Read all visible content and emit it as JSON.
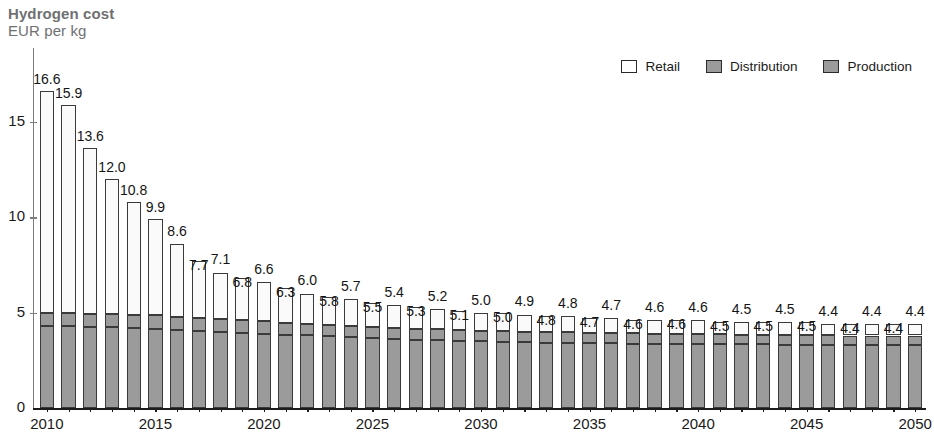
{
  "title": {
    "main": "Hydrogen cost",
    "sub": "EUR per kg"
  },
  "legend": {
    "position": "top-right",
    "items": [
      {
        "label": "Retail",
        "color": "#ffffff",
        "name": "retail"
      },
      {
        "label": "Distribution",
        "color": "#9b9b9b",
        "name": "distribution"
      },
      {
        "label": "Production",
        "color": "#9b9b9b",
        "name": "production"
      }
    ]
  },
  "chart_data": {
    "type": "bar",
    "stacked": true,
    "title": "Hydrogen cost",
    "subtitle": "EUR per kg",
    "xlabel": "",
    "ylabel": "EUR per kg",
    "ylim": [
      0,
      17.5
    ],
    "yticks": [
      0,
      5,
      10,
      15
    ],
    "ytick_labels": [
      "0",
      "5",
      "10",
      "15"
    ],
    "grid": false,
    "xtick_labels": [
      "2010",
      "2015",
      "2020",
      "2025",
      "2030",
      "2035",
      "2040",
      "2045",
      "2050"
    ],
    "categories": [
      "2010",
      "2011",
      "2012",
      "2013",
      "2014",
      "2015",
      "2016",
      "2017",
      "2018",
      "2019",
      "2020",
      "2021",
      "2022",
      "2023",
      "2024",
      "2025",
      "2026",
      "2027",
      "2028",
      "2029",
      "2030",
      "2031",
      "2032",
      "2033",
      "2034",
      "2035",
      "2036",
      "2037",
      "2038",
      "2039",
      "2040",
      "2041",
      "2042",
      "2043",
      "2044",
      "2045",
      "2046",
      "2047",
      "2048",
      "2049",
      "2050"
    ],
    "totals": [
      16.6,
      15.9,
      13.6,
      12.0,
      10.8,
      9.9,
      8.6,
      7.7,
      7.1,
      6.8,
      6.6,
      6.3,
      6.0,
      5.8,
      5.7,
      5.5,
      5.4,
      5.3,
      5.2,
      5.1,
      5.0,
      5.0,
      4.9,
      4.8,
      4.8,
      4.7,
      4.7,
      4.6,
      4.6,
      4.6,
      4.6,
      4.5,
      4.5,
      4.5,
      4.5,
      4.5,
      4.4,
      4.4,
      4.4,
      4.4,
      4.4
    ],
    "series": [
      {
        "name": "Production",
        "color": "#9b9b9b",
        "values": [
          4.3,
          4.28,
          4.25,
          4.22,
          4.18,
          4.15,
          4.1,
          4.05,
          4.0,
          3.95,
          3.9,
          3.85,
          3.8,
          3.75,
          3.7,
          3.65,
          3.62,
          3.58,
          3.55,
          3.52,
          3.5,
          3.48,
          3.45,
          3.43,
          3.42,
          3.4,
          3.4,
          3.38,
          3.37,
          3.36,
          3.35,
          3.34,
          3.33,
          3.33,
          3.32,
          3.32,
          3.31,
          3.3,
          3.3,
          3.3,
          3.3
        ]
      },
      {
        "name": "Distribution",
        "color": "#9b9b9b",
        "values": [
          0.7,
          0.7,
          0.7,
          0.7,
          0.7,
          0.7,
          0.68,
          0.67,
          0.66,
          0.65,
          0.64,
          0.63,
          0.62,
          0.61,
          0.6,
          0.59,
          0.58,
          0.58,
          0.57,
          0.56,
          0.56,
          0.55,
          0.55,
          0.54,
          0.54,
          0.53,
          0.53,
          0.53,
          0.52,
          0.52,
          0.52,
          0.52,
          0.51,
          0.51,
          0.51,
          0.51,
          0.5,
          0.5,
          0.5,
          0.5,
          0.5
        ]
      },
      {
        "name": "Retail",
        "color": "#ffffff",
        "values": [
          11.6,
          10.92,
          8.65,
          7.08,
          5.92,
          5.05,
          3.82,
          2.98,
          2.44,
          2.2,
          2.06,
          1.82,
          1.58,
          1.44,
          1.4,
          1.26,
          1.2,
          1.14,
          1.08,
          1.02,
          0.94,
          0.97,
          0.9,
          0.83,
          0.84,
          0.77,
          0.77,
          0.69,
          0.71,
          0.72,
          0.73,
          0.64,
          0.66,
          0.66,
          0.67,
          0.67,
          0.59,
          0.6,
          0.6,
          0.6,
          0.6
        ]
      }
    ],
    "data_labels": [
      "16.6",
      "15.9",
      "13.6",
      "12.0",
      "10.8",
      "9.9",
      "8.6",
      "7.7",
      "7.1",
      "6.8",
      "6.6",
      "6.3",
      "6.0",
      "5.8",
      "5.7",
      "5.5",
      "5.4",
      "5.3",
      "5.2",
      "5.1",
      "5.0",
      "5.0",
      "4.9",
      "4.8",
      "4.8",
      "4.7",
      "4.7",
      "4.6",
      "4.6",
      "4.6",
      "4.6",
      "4.5",
      "4.5",
      "4.5",
      "4.5",
      "4.5",
      "4.4",
      "4.4",
      "4.4",
      "4.4",
      "4.4"
    ]
  }
}
